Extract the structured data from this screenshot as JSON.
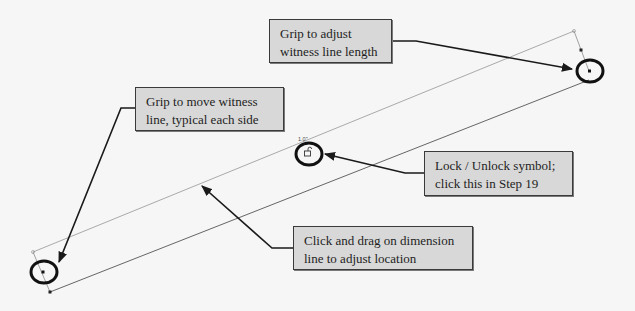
{
  "callouts": [
    {
      "id": "witness-length",
      "lines": [
        "Grip to adjust",
        "witness line length"
      ]
    },
    {
      "id": "move-witness",
      "lines": [
        "Grip to move witness",
        "line, typical each side"
      ]
    },
    {
      "id": "lock-unlock",
      "lines": [
        "Lock / Unlock symbol;",
        "click this in Step 19"
      ]
    },
    {
      "id": "drag-dimension",
      "lines": [
        "Click and drag on dimension",
        "line to adjust location"
      ]
    }
  ],
  "dimension_value_label": "1.0\"",
  "colors": {
    "background": "#f6f6f6",
    "callout_fill": "#d8d8d8",
    "callout_border": "#3a3a3a",
    "arrow": "#1a1a1a",
    "dimension_line": "#9a9a9a",
    "grip_circle": "#111111"
  }
}
